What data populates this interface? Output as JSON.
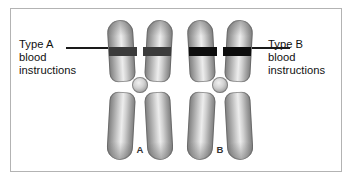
{
  "figure": {
    "background_color": "#ffffff",
    "border_color": "#b3b3b3"
  },
  "callouts": {
    "left": {
      "line1": "Type A",
      "line2": "blood",
      "line3": "instructions"
    },
    "right": {
      "line1": "Type B",
      "line2": "blood",
      "line3": "instructions"
    }
  },
  "chromosomes": [
    {
      "id": "a",
      "label": "A",
      "band_color": "#3b3b3b",
      "body_color": "#b0b0b0",
      "allele": "Type A blood instructions"
    },
    {
      "id": "b",
      "label": "B",
      "band_color": "#0d0d0d",
      "body_color": "#b0b0b0",
      "allele": "Type B blood instructions"
    }
  ]
}
